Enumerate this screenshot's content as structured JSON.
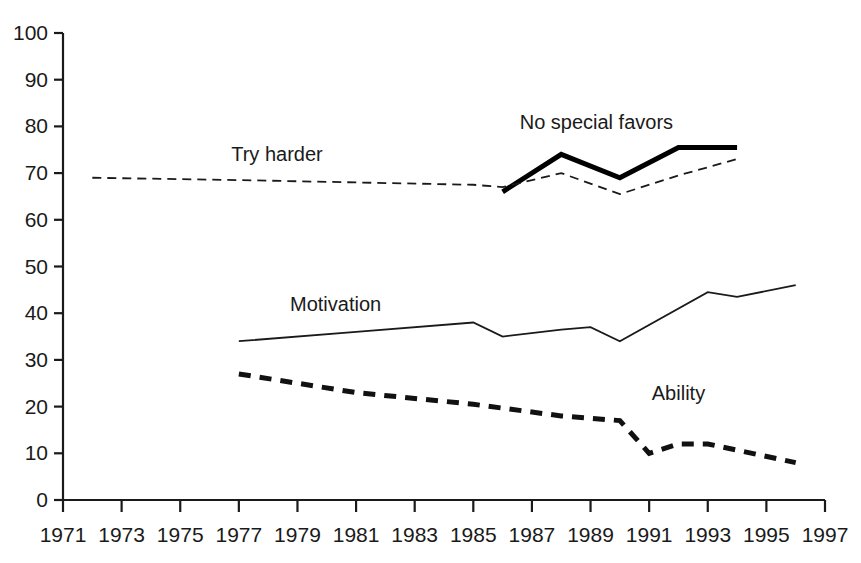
{
  "chart_data": {
    "type": "line",
    "title": "",
    "xlabel": "",
    "ylabel": "",
    "xlim": [
      1971,
      1997
    ],
    "ylim": [
      0,
      100
    ],
    "grid": false,
    "legend_position": "inline-annotations",
    "x_ticks": [
      1971,
      1973,
      1975,
      1977,
      1979,
      1981,
      1983,
      1985,
      1987,
      1989,
      1991,
      1993,
      1995,
      1997
    ],
    "y_ticks": [
      0,
      10,
      20,
      30,
      40,
      50,
      60,
      70,
      80,
      90,
      100
    ],
    "series": [
      {
        "name": "No special favors",
        "style": "thick-solid",
        "color": "#000000",
        "x": [
          1986,
          1988,
          1990,
          1992,
          1994
        ],
        "values": [
          66,
          74,
          69,
          75.5,
          75.5
        ]
      },
      {
        "name": "Try harder",
        "style": "thin-dashed",
        "color": "#1a1a1a",
        "x": [
          1972,
          1977,
          1981,
          1985,
          1986,
          1988,
          1990,
          1992,
          1994
        ],
        "values": [
          69,
          68.5,
          68,
          67.5,
          67,
          70,
          65.5,
          69.5,
          73
        ]
      },
      {
        "name": "Motivation",
        "style": "thin-solid",
        "color": "#1a1a1a",
        "x": [
          1977,
          1981,
          1985,
          1986,
          1988,
          1989,
          1990,
          1993,
          1994,
          1996
        ],
        "values": [
          34,
          36,
          38,
          35,
          36.5,
          37,
          34,
          44.5,
          43.5,
          46
        ]
      },
      {
        "name": "Ability",
        "style": "thick-dashed",
        "color": "#111111",
        "x": [
          1977,
          1981,
          1985,
          1988,
          1990,
          1991,
          1992,
          1993,
          1996
        ],
        "values": [
          27,
          23,
          20.5,
          18,
          17,
          10,
          12,
          12,
          8
        ]
      }
    ],
    "annotations": [
      {
        "text": "No special favors",
        "x": 1989.2,
        "y": 79.5,
        "anchor": "middle"
      },
      {
        "text": "Try harder",
        "x": 1978.3,
        "y": 72.5,
        "anchor": "middle"
      },
      {
        "text": "Motivation",
        "x": 1980.3,
        "y": 40.5,
        "anchor": "middle"
      },
      {
        "text": "Ability",
        "x": 1992.0,
        "y": 21.5,
        "anchor": "middle"
      }
    ]
  }
}
